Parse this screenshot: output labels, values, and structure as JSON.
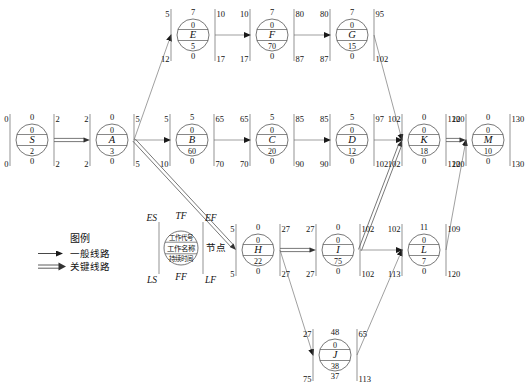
{
  "diagram": {
    "node_letters": [
      "S",
      "A",
      "B",
      "C",
      "D",
      "E",
      "F",
      "G",
      "H",
      "I",
      "J",
      "K",
      "L",
      "M"
    ],
    "nodes": [
      {
        "id": "S",
        "letter": "S",
        "cx": 32,
        "cy": 140,
        "es": 0,
        "tf": 0,
        "ef": 2,
        "code": "0",
        "dur": 2,
        "ls": 0,
        "ff": 0,
        "lf": 2,
        "critical": true
      },
      {
        "id": "A",
        "letter": "A",
        "cx": 112,
        "cy": 140,
        "es": 2,
        "tf": 0,
        "ef": 5,
        "code": "0",
        "dur": 3,
        "ls": 2,
        "ff": 0,
        "lf": 5,
        "critical": true
      },
      {
        "id": "B",
        "letter": "B",
        "cx": 192,
        "cy": 140,
        "es": 5,
        "tf": 5,
        "ef": 65,
        "code": "0",
        "dur": 60,
        "ls": 10,
        "ff": 0,
        "lf": 70,
        "critical": false
      },
      {
        "id": "C",
        "letter": "C",
        "cx": 272,
        "cy": 140,
        "es": 65,
        "tf": 5,
        "ef": 85,
        "code": "0",
        "dur": 20,
        "ls": 70,
        "ff": 0,
        "lf": 90,
        "critical": false
      },
      {
        "id": "D",
        "letter": "D",
        "cx": 352,
        "cy": 140,
        "es": 85,
        "tf": 5,
        "ef": 97,
        "code": "0",
        "dur": 12,
        "ls": 90,
        "ff": 0,
        "lf": 102,
        "critical": false
      },
      {
        "id": "E",
        "letter": "E",
        "cx": 193,
        "cy": 35,
        "es": 5,
        "tf": 7,
        "ef": 10,
        "code": "0",
        "dur": 5,
        "ls": 12,
        "ff": 0,
        "lf": 17,
        "critical": false
      },
      {
        "id": "F",
        "letter": "F",
        "cx": 272,
        "cy": 35,
        "es": 10,
        "tf": 7,
        "ef": 80,
        "code": "0",
        "dur": 70,
        "ls": 17,
        "ff": 0,
        "lf": 87,
        "critical": false
      },
      {
        "id": "G",
        "letter": "G",
        "cx": 352,
        "cy": 35,
        "es": 80,
        "tf": 7,
        "ef": 95,
        "code": "0",
        "dur": 15,
        "ls": 87,
        "ff": 0,
        "lf": 102,
        "critical": false
      },
      {
        "id": "H",
        "letter": "H",
        "cx": 258,
        "cy": 250,
        "es": 5,
        "tf": 0,
        "ef": 27,
        "code": "0",
        "dur": 22,
        "ls": 5,
        "ff": 0,
        "lf": 27,
        "critical": true
      },
      {
        "id": "I",
        "letter": "I",
        "cx": 338,
        "cy": 250,
        "es": 27,
        "tf": 0,
        "ef": 102,
        "code": "0",
        "dur": 75,
        "ls": 27,
        "ff": 0,
        "lf": 102,
        "critical": true
      },
      {
        "id": "J",
        "letter": "J",
        "cx": 335,
        "cy": 355,
        "es": 27,
        "tf": 48,
        "ef": 65,
        "code": "0",
        "dur": 38,
        "ls": 75,
        "ff": 37,
        "lf": 113,
        "critical": false
      },
      {
        "id": "K",
        "letter": "K",
        "cx": 424,
        "cy": 140,
        "es": 102,
        "tf": 0,
        "ef": 120,
        "code": "0",
        "dur": 18,
        "ls": 102,
        "ff": 0,
        "lf": 120,
        "critical": true
      },
      {
        "id": "L",
        "letter": "L",
        "cx": 424,
        "cy": 250,
        "es": 102,
        "tf": 11,
        "ef": 109,
        "code": "0",
        "dur": 7,
        "ls": 113,
        "ff": 0,
        "lf": 120,
        "critical": false
      },
      {
        "id": "M",
        "letter": "M",
        "cx": 488,
        "cy": 140,
        "es": 120,
        "tf": 0,
        "ef": 130,
        "code": "0",
        "dur": 10,
        "ls": 120,
        "ff": 0,
        "lf": 130,
        "critical": true
      }
    ],
    "edges": [
      {
        "from": "S",
        "to": "A",
        "critical": true
      },
      {
        "from": "A",
        "to": "E",
        "critical": false
      },
      {
        "from": "A",
        "to": "B",
        "critical": false
      },
      {
        "from": "A",
        "to": "H",
        "critical": true
      },
      {
        "from": "E",
        "to": "F",
        "critical": false
      },
      {
        "from": "F",
        "to": "G",
        "critical": false
      },
      {
        "from": "G",
        "to": "K",
        "critical": false
      },
      {
        "from": "B",
        "to": "C",
        "critical": false
      },
      {
        "from": "C",
        "to": "D",
        "critical": false
      },
      {
        "from": "D",
        "to": "K",
        "critical": false
      },
      {
        "from": "H",
        "to": "I",
        "critical": true
      },
      {
        "from": "H",
        "to": "J",
        "critical": false
      },
      {
        "from": "I",
        "to": "K",
        "critical": true
      },
      {
        "from": "I",
        "to": "L",
        "critical": false
      },
      {
        "from": "J",
        "to": "L",
        "critical": false
      },
      {
        "from": "K",
        "to": "M",
        "critical": true
      },
      {
        "from": "L",
        "to": "M",
        "critical": false
      }
    ]
  },
  "legend": {
    "title": "图例",
    "general_label": "一般线路",
    "critical_label": "关键线路",
    "node_sample": {
      "es": "ES",
      "tf": "TF",
      "ef": "EF",
      "ls": "LS",
      "ff": "FF",
      "lf": "LF",
      "row_code": "工作代号",
      "row_name": "工作名称",
      "row_duration": "持续时间",
      "node_word": "节点"
    }
  }
}
